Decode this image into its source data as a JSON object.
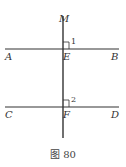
{
  "figure": {
    "caption": "图 80",
    "points": {
      "M": "M",
      "A": "A",
      "B": "B",
      "C": "C",
      "D": "D",
      "E": "E",
      "F": "F"
    },
    "angles": {
      "angle1": "1",
      "angle2": "2"
    },
    "lines": [
      "AB",
      "CD",
      "MF"
    ],
    "line_color": "#333333"
  }
}
